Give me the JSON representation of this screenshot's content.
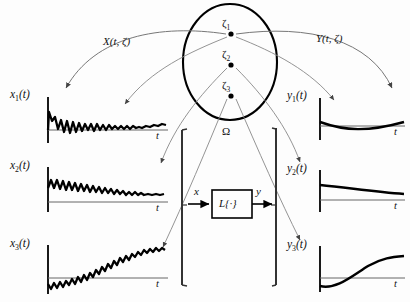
{
  "figure": {
    "sample_space": {
      "name": "sample-space-ellipse",
      "label": "Ω",
      "outcomes": [
        {
          "label": "ζ",
          "sub": "1"
        },
        {
          "label": "ζ",
          "sub": "2"
        },
        {
          "label": "ζ",
          "sub": "3"
        }
      ]
    },
    "mappings": {
      "input_process": "X(t, ζ)",
      "output_process": "Y(t, ζ)"
    },
    "system": {
      "block_label": "L{·}",
      "input_label": "x",
      "output_label": "y"
    },
    "input_panels": [
      {
        "name": "x",
        "sub": "1",
        "suffix": "(t)",
        "axis_label": "t"
      },
      {
        "name": "x",
        "sub": "2",
        "suffix": "(t)",
        "axis_label": "t"
      },
      {
        "name": "x",
        "sub": "3",
        "suffix": "(t)",
        "axis_label": "t"
      }
    ],
    "output_panels": [
      {
        "name": "y",
        "sub": "1",
        "suffix": "(t)",
        "axis_label": "t"
      },
      {
        "name": "y",
        "sub": "2",
        "suffix": "(t)",
        "axis_label": "t"
      },
      {
        "name": "y",
        "sub": "3",
        "suffix": "(t)",
        "axis_label": "t"
      }
    ],
    "colors": {
      "ink": "#000000",
      "thin_line": "#555555",
      "background": "#fdfdfd"
    }
  }
}
